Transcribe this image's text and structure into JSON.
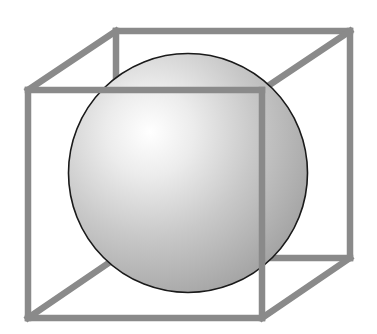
{
  "figure": {
    "width": 377,
    "height": 334,
    "background": "#ffffff"
  },
  "cube": {
    "stroke_color": "#8a8a8a",
    "stroke_width": 6.5,
    "front_face": {
      "top_left": [
        28,
        90
      ],
      "top_right": [
        262,
        90
      ],
      "bottom_right": [
        262,
        318
      ],
      "bottom_left": [
        28,
        318
      ]
    },
    "back_face": {
      "top_left": [
        116,
        31
      ],
      "top_right": [
        350,
        31
      ],
      "bottom_right": [
        350,
        258
      ],
      "bottom_left": [
        116,
        258
      ]
    }
  },
  "sphere": {
    "center": [
      188,
      173
    ],
    "radius": 119.5,
    "outline_color": "#1a1a1a",
    "highlight_center": [
      150,
      132
    ],
    "gradient": [
      "#ffffff",
      "#e6e6e6",
      "#c4c4c4",
      "#a9a9a9"
    ]
  }
}
